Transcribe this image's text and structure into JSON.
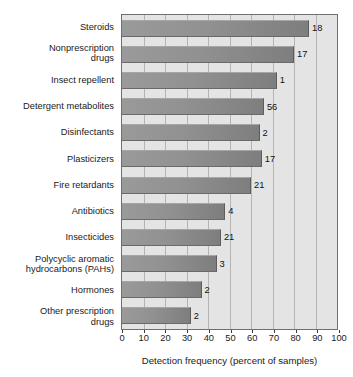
{
  "chart_data": {
    "type": "bar",
    "title": "",
    "orientation": "horizontal",
    "xlabel": "Detection frequency (percent of samples)",
    "ylabel": "",
    "xlim": [
      0,
      100
    ],
    "xticks": [
      0,
      10,
      20,
      30,
      40,
      50,
      60,
      70,
      80,
      90,
      100
    ],
    "grid": true,
    "legend": "none",
    "categories": [
      "Steroids",
      "Nonprescription\ndrugs",
      "Insect repellent",
      "Detergent metabolites",
      "Disinfectants",
      "Plasticizers",
      "Fire retardants",
      "Antibiotics",
      "Insecticides",
      "Polycyclic aromatic\nhydrocarbons (PAHs)",
      "Hormones",
      "Other prescription\ndrugs"
    ],
    "values": [
      87,
      80,
      72,
      66,
      64,
      65,
      60,
      48,
      46,
      44,
      37,
      32
    ],
    "bar_labels": [
      "18",
      "17",
      "1",
      "56",
      "2",
      "17",
      "21",
      "4",
      "21",
      "3",
      "2",
      "2"
    ],
    "bar_color": "#8d8d8d",
    "plot_background": "#e4e4e4",
    "gridline_color": "#b4b4b4"
  }
}
